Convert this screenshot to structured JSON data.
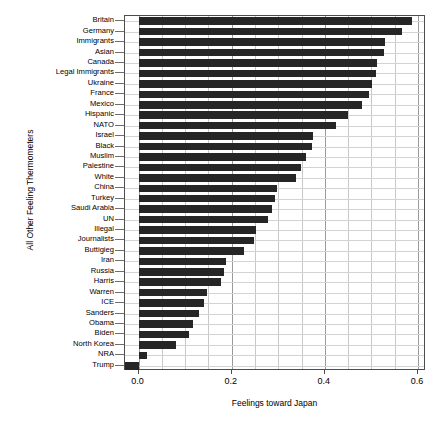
{
  "chart_data": {
    "type": "bar",
    "orientation": "horizontal",
    "title": "",
    "xlabel": "Feelings toward Japan",
    "ylabel": "All Other Feeling Thermometers",
    "xlim": [
      -0.029,
      0.617
    ],
    "xticks": [
      0.0,
      0.2,
      0.4,
      0.6
    ],
    "xtick_labels": [
      "0.0",
      "0.2",
      "0.4",
      "0.6"
    ],
    "grid": true,
    "grid_minor_step": 0.05,
    "bar_color": "#262626",
    "categories": [
      "Britain",
      "Germany",
      "Immigrants",
      "Asian",
      "Canada",
      "Legal Immigrants",
      "Ukraine",
      "France",
      "Mexico",
      "Hispanic",
      "NATO",
      "Israel",
      "Black",
      "Muslim",
      "Palestine",
      "White",
      "China",
      "Turkey",
      "Saudi Arabia",
      "UN",
      "Illegal",
      "Journalists",
      "Buttigieg",
      "Iran",
      "Russia",
      "Harris",
      "Warren",
      "ICE",
      "Sanders",
      "Obama",
      "Biden",
      "North Korea",
      "NRA",
      "Trump"
    ],
    "values": [
      0.588,
      0.566,
      0.53,
      0.526,
      0.511,
      0.509,
      0.502,
      0.495,
      0.48,
      0.45,
      0.423,
      0.374,
      0.372,
      0.359,
      0.348,
      0.337,
      0.298,
      0.294,
      0.287,
      0.277,
      0.252,
      0.248,
      0.226,
      0.187,
      0.184,
      0.177,
      0.148,
      0.141,
      0.13,
      0.116,
      0.109,
      0.08,
      0.019,
      -0.028
    ]
  }
}
